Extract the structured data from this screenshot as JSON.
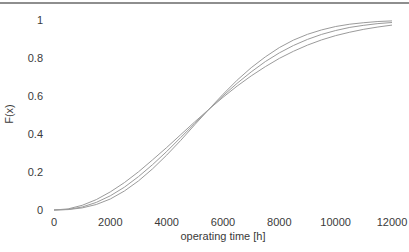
{
  "figure": {
    "background": "#ffffff",
    "top_rule_color": "#8e8e8e",
    "text_color": "#3a3a3a"
  },
  "chart_data": {
    "type": "line",
    "title": "",
    "xlabel": "operating time [h]",
    "ylabel": "F(x)",
    "xlim": [
      0,
      12000
    ],
    "ylim": [
      0,
      1
    ],
    "xticks": [
      0,
      2000,
      4000,
      6000,
      8000,
      10000,
      12000
    ],
    "xtick_labels": [
      "0",
      "2000",
      "4000",
      "6000",
      "8000",
      "10000",
      "12000"
    ],
    "yticks": [
      0,
      0.2,
      0.4,
      0.6,
      0.8,
      1
    ],
    "ytick_labels": [
      "0",
      "0.2",
      "0.4",
      "0.6",
      "0.8",
      "1"
    ],
    "grid": false,
    "axis_lines": false,
    "legend": null,
    "line_color": "#9b9b9b",
    "line_width": 1,
    "x": [
      0,
      500,
      1000,
      1500,
      2000,
      2500,
      3000,
      3500,
      4000,
      4500,
      5000,
      5500,
      6000,
      6500,
      7000,
      7500,
      8000,
      8500,
      9000,
      9500,
      10000,
      10500,
      11000,
      11500,
      12000
    ],
    "series": [
      {
        "name": "cdf-shallow",
        "values": [
          0,
          0.006,
          0.025,
          0.055,
          0.095,
          0.144,
          0.201,
          0.264,
          0.329,
          0.397,
          0.464,
          0.53,
          0.593,
          0.652,
          0.706,
          0.754,
          0.798,
          0.835,
          0.868,
          0.895,
          0.918,
          0.936,
          0.951,
          0.963,
          0.973
        ]
      },
      {
        "name": "cdf-middle",
        "values": [
          0,
          0.003,
          0.016,
          0.04,
          0.075,
          0.12,
          0.176,
          0.239,
          0.308,
          0.382,
          0.456,
          0.53,
          0.601,
          0.667,
          0.727,
          0.781,
          0.827,
          0.866,
          0.898,
          0.924,
          0.945,
          0.961,
          0.972,
          0.981,
          0.987
        ]
      },
      {
        "name": "cdf-steep",
        "values": [
          0,
          0.002,
          0.011,
          0.029,
          0.058,
          0.1,
          0.153,
          0.217,
          0.289,
          0.367,
          0.449,
          0.53,
          0.609,
          0.683,
          0.749,
          0.806,
          0.855,
          0.894,
          0.925,
          0.948,
          0.966,
          0.978,
          0.986,
          0.992,
          0.995
        ]
      }
    ]
  }
}
